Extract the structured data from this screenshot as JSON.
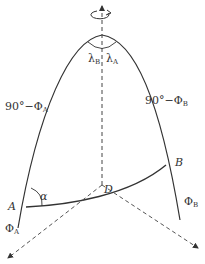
{
  "diagram": {
    "type": "spherical-geometry",
    "points": {
      "A": "A",
      "B": "B"
    },
    "labels": {
      "colatitude_A": "90°−Φ",
      "colatitude_A_sub": "A",
      "colatitude_B": "90°−Φ",
      "colatitude_B_sub": "B",
      "latitude_A": "Φ",
      "latitude_A_sub": "A",
      "latitude_B": "Φ",
      "latitude_B_sub": "B",
      "longitude_A": "λ",
      "longitude_A_sub": "A",
      "longitude_B": "λ",
      "longitude_B_sub": "B",
      "azimuth": "α",
      "distance": "D"
    },
    "colors": {
      "line": "#333333",
      "dashed": "#555555",
      "background": "#ffffff"
    }
  }
}
